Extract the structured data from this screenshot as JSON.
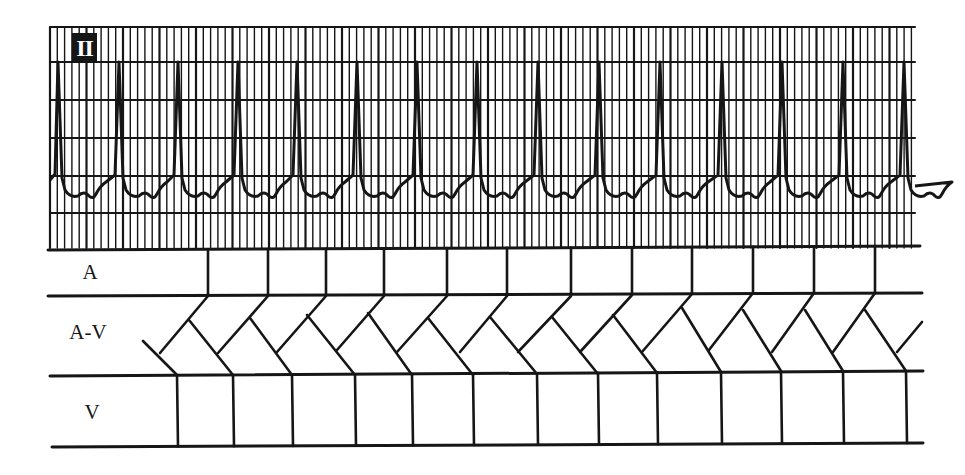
{
  "figure": {
    "lead_label": "II",
    "ink_color": "#161616",
    "paper_color": "#ffffff"
  },
  "ecg": {
    "strip": {
      "x0": 50,
      "x1": 915,
      "y0": 27,
      "y1": 250
    },
    "grid": {
      "minor_dx": 7.3,
      "major_every": 5,
      "horizontal_lines_y": [
        27,
        62,
        100,
        138,
        176,
        213
      ]
    },
    "baseline_y": 178,
    "r_peak_y": 62,
    "r_peaks_x": [
      58,
      119,
      178,
      238,
      297,
      357,
      417,
      477,
      538,
      599,
      660,
      722,
      782,
      843,
      904
    ]
  },
  "ladder": {
    "rows": [
      {
        "id": "A",
        "label": "A",
        "label_x": 90,
        "label_y": 272
      },
      {
        "id": "AV",
        "label": "A-V",
        "label_x": 88,
        "label_y": 332
      },
      {
        "id": "V",
        "label": "V",
        "label_x": 92,
        "label_y": 412
      }
    ],
    "horizontal_lines": [
      {
        "y_left": 250,
        "y_right": 246,
        "x0": 48,
        "x1": 920
      },
      {
        "y_left": 296,
        "y_right": 293,
        "x0": 48,
        "x1": 922
      },
      {
        "y_left": 376,
        "y_right": 371,
        "x0": 50,
        "x1": 923
      },
      {
        "y_left": 447,
        "y_right": 443,
        "x0": 52,
        "x1": 923
      }
    ],
    "atrial_x": [
      208,
      268,
      326,
      384,
      447,
      507,
      571,
      632,
      692,
      753,
      814,
      875
    ],
    "ventricular_x": [
      177,
      233,
      292,
      355,
      412,
      473,
      537,
      598,
      657,
      721,
      781,
      843,
      906
    ],
    "retrograde_segments": [
      [
        160,
        353,
        208,
        296
      ],
      [
        218,
        353,
        268,
        296
      ],
      [
        277,
        352,
        326,
        296
      ],
      [
        337,
        350,
        384,
        296
      ],
      [
        397,
        352,
        447,
        296
      ],
      [
        460,
        352,
        507,
        296
      ],
      [
        518,
        352,
        571,
        296
      ],
      [
        580,
        352,
        632,
        295
      ],
      [
        642,
        352,
        692,
        294
      ],
      [
        709,
        350,
        753,
        293
      ],
      [
        772,
        352,
        814,
        293
      ],
      [
        833,
        352,
        875,
        293
      ],
      [
        897,
        352,
        922,
        322
      ]
    ],
    "anterograde_segments": [
      [
        143,
        341,
        177,
        375
      ],
      [
        189,
        320,
        233,
        375
      ],
      [
        250,
        318,
        292,
        375
      ],
      [
        307,
        315,
        355,
        375
      ],
      [
        368,
        313,
        412,
        375
      ],
      [
        428,
        318,
        473,
        375
      ],
      [
        490,
        317,
        537,
        374
      ],
      [
        552,
        317,
        598,
        374
      ],
      [
        613,
        315,
        657,
        373
      ],
      [
        682,
        308,
        721,
        372
      ],
      [
        743,
        310,
        781,
        371
      ],
      [
        805,
        310,
        843,
        371
      ],
      [
        865,
        310,
        906,
        371
      ]
    ]
  }
}
